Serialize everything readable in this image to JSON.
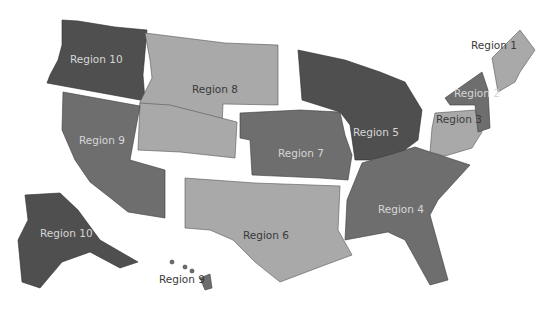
{
  "map": {
    "title": "",
    "shades": {
      "dark": "#4f4f4f",
      "mid": "#6e6e6e",
      "light": "#a9a9a9",
      "background": "#ffffff"
    },
    "regions": [
      {
        "id": "region-1",
        "label": "Region 1",
        "shade": "light"
      },
      {
        "id": "region-2",
        "label": "Region 2",
        "shade": "mid"
      },
      {
        "id": "region-3",
        "label": "Region 3",
        "shade": "light"
      },
      {
        "id": "region-4",
        "label": "Region 4",
        "shade": "mid"
      },
      {
        "id": "region-5",
        "label": "Region 5",
        "shade": "dark"
      },
      {
        "id": "region-6",
        "label": "Region 6",
        "shade": "light"
      },
      {
        "id": "region-7",
        "label": "Region 7",
        "shade": "mid"
      },
      {
        "id": "region-8",
        "label": "Region 8",
        "shade": "light"
      },
      {
        "id": "region-9-mainland",
        "label": "Region 9",
        "shade": "mid"
      },
      {
        "id": "region-9-hawaii",
        "label": "Region 9",
        "shade": "mid"
      },
      {
        "id": "region-10-northwest",
        "label": "Region 10",
        "shade": "dark"
      },
      {
        "id": "region-10-alaska",
        "label": "Region 10",
        "shade": "dark"
      }
    ]
  }
}
